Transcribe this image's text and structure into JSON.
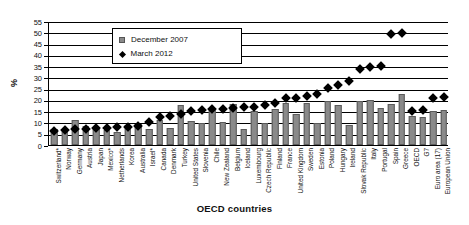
{
  "chart_data": {
    "type": "bar",
    "title": "",
    "xlabel": "OECD countries",
    "ylabel": "%",
    "ylim": [
      0,
      55
    ],
    "ytick_step": 5,
    "yticks": [
      0,
      5,
      10,
      15,
      20,
      25,
      30,
      35,
      40,
      45,
      50,
      55
    ],
    "grid": true,
    "legend_position": "top-left-inside",
    "categories": [
      "Switzerland*",
      "Norway",
      "Germany",
      "Austria",
      "Japan",
      "Mexico*",
      "Netherlands",
      "Korea",
      "Australia",
      "Israel*",
      "Canada",
      "Denmark",
      "Turkey",
      "United States",
      "Slovenia",
      "Chile",
      "New Zealand",
      "Belgium",
      "Iceland",
      "Luxembourg",
      "Czech Republic",
      "Finland",
      "France",
      "United Kingdom",
      "Sweden",
      "Estonia",
      "Poland",
      "Hungary",
      "Ireland",
      "Slovak Republic",
      "Italy",
      "Portugal",
      "Spain",
      "Greece",
      "OECD",
      "G7",
      "Euro area (17)",
      "European Union"
    ],
    "series": [
      {
        "name": "December 2007",
        "type": "bar",
        "color": "#8a8a8a",
        "values": [
          7.0,
          7.3,
          11.0,
          8.6,
          7.6,
          6.5,
          5.8,
          8.8,
          9.2,
          7.0,
          11.2,
          7.5,
          17.8,
          10.6,
          9.8,
          16.0,
          10.1,
          18.2,
          7.0,
          15.2,
          9.7,
          15.8,
          18.6,
          13.9,
          18.8,
          9.9,
          19.6,
          17.8,
          9.0,
          19.6,
          19.8,
          16.2,
          18.2,
          22.5,
          12.8,
          12.5,
          15.2,
          15.4
        ]
      },
      {
        "name": "March 2012",
        "type": "scatter-diamond",
        "color": "#000000",
        "values": [
          7.5,
          7.6,
          8.1,
          8.4,
          8.6,
          8.8,
          9.0,
          9.2,
          9.4,
          11.2,
          13.6,
          14.0,
          14.7,
          16.4,
          16.8,
          17.0,
          17.2,
          17.6,
          17.8,
          18.0,
          18.8,
          19.6,
          21.8,
          22.0,
          23.0,
          23.8,
          26.5,
          27.6,
          29.5,
          34.8,
          35.6,
          36.0,
          50.5,
          50.8,
          16.2,
          16.8,
          21.8,
          22.4
        ]
      }
    ]
  },
  "legend": {
    "items": [
      {
        "label": "December 2007",
        "symbol": "square"
      },
      {
        "label": "March 2012",
        "symbol": "diamond"
      }
    ]
  },
  "axes": {
    "y_title": "%",
    "x_title": "OECD countries"
  }
}
